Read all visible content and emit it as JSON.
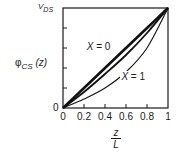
{
  "chart_data": {
    "type": "line",
    "title": "",
    "xlabel_num": "z",
    "xlabel_den": "L",
    "ylabel": "φCS (z)",
    "ylabel_parts": {
      "symbol": "φ",
      "sub": "CS",
      "arg": " (z)"
    },
    "y_top_label": "VDS",
    "y_top_label_parts": {
      "main": "V",
      "sub": "DS"
    },
    "y_bottom_label": "0",
    "xlim": [
      0,
      1
    ],
    "ylim": [
      0,
      1
    ],
    "x_ticks": [
      "0",
      "0.2",
      "0.4",
      "0.6",
      "0.8",
      "1"
    ],
    "y_ticks_positions": [
      0.2,
      0.4,
      0.6,
      0.8
    ],
    "grid": false,
    "annotations": [
      {
        "text": "X = 0",
        "x": 0.35,
        "y": 0.6
      },
      {
        "text": "X = 1",
        "x": 0.68,
        "y": 0.3
      }
    ],
    "series": [
      {
        "name": "X = 0",
        "x": [
          0,
          0.2,
          0.4,
          0.6,
          0.8,
          1
        ],
        "values": [
          0,
          0.2,
          0.4,
          0.6,
          0.8,
          1
        ],
        "width": "thick"
      },
      {
        "name": "intermediate X",
        "x": [
          0,
          0.2,
          0.4,
          0.6,
          0.8,
          1
        ],
        "values": [
          0,
          0.16,
          0.34,
          0.53,
          0.75,
          1
        ],
        "width": "medium"
      },
      {
        "name": "X = 1",
        "x": [
          0,
          0.2,
          0.4,
          0.6,
          0.8,
          1
        ],
        "values": [
          0,
          0.09,
          0.2,
          0.36,
          0.6,
          1
        ],
        "width": "thin"
      }
    ]
  }
}
